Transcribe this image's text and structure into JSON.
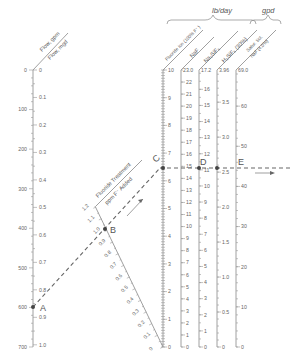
{
  "units": {
    "lb_day": "lb/day",
    "gpd": "gpd"
  },
  "axes": {
    "flow": {
      "gpm_label": "Flow, gpm",
      "mgd_label": "Flow, mgd",
      "gpm_ticks": [
        "0",
        "100",
        "200",
        "300",
        "400",
        "500",
        "600",
        "700"
      ],
      "mgd_ticks": [
        "0",
        "0.1",
        "0.2",
        "0.3",
        "0.4",
        "0.5",
        "0.6",
        "0.7",
        "0.8",
        "0.9",
        "1.0"
      ]
    },
    "treatment": {
      "label_line1": "Fluoride Treatment",
      "label_line2": "ppm F⁻ Added",
      "ticks": [
        "0",
        "0.1",
        "0.2",
        "0.3",
        "0.4",
        "0.5",
        "0.6",
        "0.7",
        "0.8",
        "0.9",
        "1.0",
        "1.1",
        "1.2"
      ]
    },
    "fluoride_ion": {
      "label": "Fluoride Ion (100% F⁻)",
      "ticks": [
        "0",
        "1",
        "2",
        "3",
        "4",
        "5",
        "6",
        "7",
        "8",
        "9",
        "10"
      ]
    },
    "naf": {
      "label": "NaF",
      "ticks": [
        "0",
        "1",
        "2",
        "3",
        "4",
        "5",
        "6",
        "7",
        "8",
        "9",
        "10",
        "11",
        "12",
        "13",
        "14",
        "15",
        "16",
        "17",
        "18",
        "19",
        "20",
        "21",
        "22"
      ],
      "top": "23.0"
    },
    "na2sif6": {
      "label": "Na₂SiF₆",
      "ticks": [
        "0",
        "1",
        "2",
        "3",
        "4",
        "5",
        "6",
        "7",
        "8",
        "9",
        "10",
        "11",
        "12",
        "13",
        "14",
        "15",
        "16"
      ],
      "top": "17.2"
    },
    "h2sif6": {
      "label": "H₂SiF₆ (30%)",
      "ticks": [
        "0",
        "0.5",
        "1.0",
        "1.5",
        "2.0",
        "2.5",
        "3.0",
        "3.5"
      ],
      "top": "3.96"
    },
    "satsol": {
      "label_line1": "Satur. Sol.",
      "label_line2": "NaF (4.0%)",
      "ticks": [
        "0",
        "10",
        "20",
        "30",
        "40",
        "50",
        "60"
      ],
      "top": "69.0"
    }
  },
  "points": {
    "A": "A",
    "B": "B",
    "C": "C",
    "D": "D",
    "E": "E"
  },
  "example": {
    "flow_gpm": 600,
    "flow_mgd": 0.864,
    "treatment_ppm": 0.9,
    "fluoride_ion_lb_day": 6.5,
    "naf_lb_day": 14.9,
    "na2sif6_lb_day": 11.1,
    "h2sif6_gpd": 2.55,
    "satsol_gpd": 44.8
  },
  "colors": {
    "axis": "#888888",
    "text": "#555555",
    "dash": "#666666",
    "point": "#444444"
  }
}
